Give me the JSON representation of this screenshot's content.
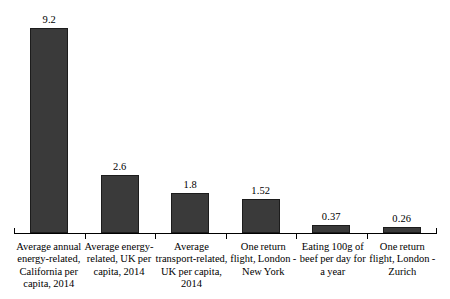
{
  "chart_data": {
    "type": "bar",
    "title": "",
    "subtitle": "",
    "xlabel": "",
    "ylabel": "",
    "ylim": [
      0,
      9.2
    ],
    "grid": false,
    "legend": false,
    "categories": [
      "Average annual energy-related, California per capita, 2014",
      "Average energy-related, UK per capita, 2014",
      "Average transport-related, UK per capita, 2014",
      "One return flight, London - New York",
      "Eating 100g of beef per day for a year",
      "One return flight, London - Zurich"
    ],
    "category_lines": [
      [
        "Average annual",
        "energy-related,",
        "California per",
        "capita, 2014"
      ],
      [
        "Average energy-",
        "related, UK per",
        "capita, 2014"
      ],
      [
        "Average",
        "transport-related,",
        "UK per capita,",
        "2014"
      ],
      [
        "One return",
        "flight, London -",
        "New York"
      ],
      [
        "Eating 100g of",
        "beef per day for",
        "a year"
      ],
      [
        "One return",
        "flight, London -",
        "Zurich"
      ]
    ],
    "values": [
      9.2,
      2.6,
      1.8,
      1.52,
      0.37,
      0.26
    ],
    "value_labels": [
      "9.2",
      "2.6",
      "1.8",
      "1.52",
      "0.37",
      "0.26"
    ],
    "bar_color": "#3a3a3a",
    "bar_edge_color": "#1c1c1c",
    "axis_color": "#000000",
    "background_color": "#ffffff"
  }
}
